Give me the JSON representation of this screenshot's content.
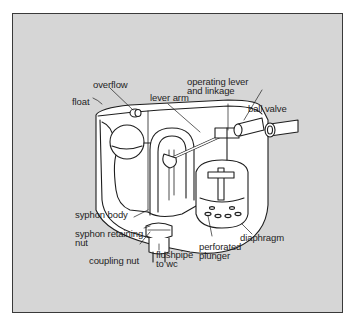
{
  "figure": {
    "background_color": "#d6d6d6",
    "border_color": "#3a3a3a",
    "line_color": "#1e1e1e",
    "body_color": "#ffffff"
  },
  "labels": {
    "overflow": "overflow",
    "float": "float",
    "lever_arm": "lever arm",
    "operating_lever_1": "operating lever",
    "operating_lever_2": "and linkage",
    "ball_valve": "ball valve",
    "syphon_body": "syphon body",
    "syphon_retaining_1": "syphon retaining",
    "syphon_retaining_2": "nut",
    "coupling_nut": "coupling nut",
    "flushpipe_1": "flushpipe",
    "flushpipe_2": "to wc",
    "perforated_1": "perforated",
    "perforated_2": "plunger",
    "diaphragm": "diaphragm"
  }
}
